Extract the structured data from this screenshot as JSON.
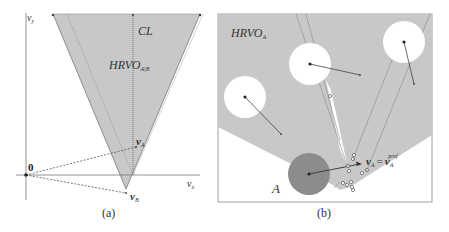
{
  "panel_a": {
    "caption": "(a)",
    "axis_x_label": "v",
    "axis_x_sub": "x",
    "axis_y_label": "v",
    "axis_y_sub": "y",
    "origin_label": "0",
    "region_label": "HRVO",
    "region_sub": "A|B",
    "centerline_label": "CL",
    "va_label": "v",
    "va_sub": "A",
    "vb_label": "v",
    "vb_sub": "B"
  },
  "panel_b": {
    "caption": "(b)",
    "region_label": "HRVO",
    "region_sub": "A",
    "agent_label": "A",
    "eq_lhs": "v",
    "eq_lhs_sub": "A",
    "eq_sign": "=",
    "eq_rhs": "v",
    "eq_rhs_sub": "A",
    "eq_rhs_sup": "pref"
  },
  "colors": {
    "region_fill": "#c8c8c8",
    "agent_fill": "#8c8c8c",
    "obstacle_fill": "#ffffff",
    "line": "#555555"
  }
}
